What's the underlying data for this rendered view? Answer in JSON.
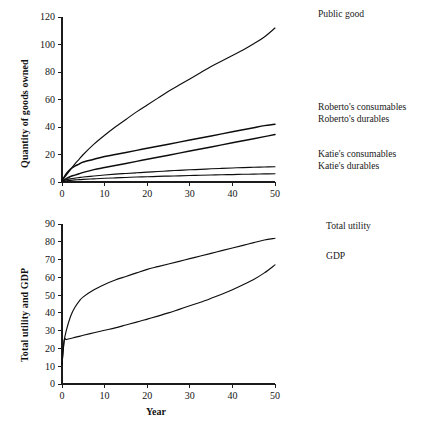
{
  "figure": {
    "background": "#ffffff",
    "line_color": "#0d0d0d"
  },
  "panels": {
    "top": {
      "ylabel": "Quantity of goods owned",
      "xlabel": "",
      "yticks": [
        "0",
        "20",
        "40",
        "60",
        "80",
        "100",
        "120"
      ],
      "xticks": [
        "0",
        "10",
        "20",
        "30",
        "40",
        "50"
      ],
      "legend": [
        {
          "label": "Public good"
        },
        {
          "label": "Roberto's consumables"
        },
        {
          "label": "Roberto's durables"
        },
        {
          "label": "Katie's consumables"
        },
        {
          "label": "Katie's durables"
        }
      ]
    },
    "bottom": {
      "ylabel": "Total utility and GDP",
      "xlabel": "Year",
      "yticks": [
        "0",
        "10",
        "20",
        "30",
        "40",
        "50",
        "60",
        "70",
        "80",
        "90"
      ],
      "xticks": [
        "0",
        "10",
        "20",
        "30",
        "40",
        "50"
      ],
      "legend": [
        {
          "label": "Total utility"
        },
        {
          "label": "GDP"
        }
      ]
    }
  },
  "chart_data": [
    {
      "type": "line",
      "title": "",
      "xlabel": "",
      "ylabel": "Quantity of goods owned",
      "xlim": [
        0,
        50
      ],
      "ylim": [
        0,
        120
      ],
      "xticks": [
        0,
        10,
        20,
        30,
        40,
        50
      ],
      "yticks": [
        0,
        20,
        40,
        60,
        80,
        100,
        120
      ],
      "grid": false,
      "legend_position": "right-outside",
      "x": [
        0,
        1,
        2,
        3,
        4,
        5,
        7.5,
        10,
        12.5,
        15,
        17.5,
        20,
        22.5,
        25,
        27.5,
        30,
        32.5,
        35,
        37.5,
        40,
        42.5,
        45,
        47.5,
        50
      ],
      "series": [
        {
          "name": "Public good",
          "values": [
            1,
            5,
            9,
            13,
            16.5,
            20,
            27.5,
            34,
            40,
            45.5,
            51,
            56,
            61,
            66,
            70.5,
            75,
            79.5,
            84,
            88,
            92,
            96,
            100.5,
            105.5,
            112
          ]
        },
        {
          "name": "Roberto's consumables",
          "values": [
            1,
            6,
            9.5,
            11.5,
            13,
            14.5,
            16.5,
            18.5,
            20,
            21.5,
            23,
            24.5,
            26,
            27.5,
            29,
            30.5,
            32,
            33.5,
            35,
            36.5,
            38,
            39.5,
            41,
            42
          ]
        },
        {
          "name": "Roberto's durables",
          "values": [
            0.5,
            2.5,
            4,
            5,
            6,
            7,
            9,
            10.5,
            12,
            13.5,
            15,
            16.5,
            18,
            19.5,
            21,
            22.5,
            24,
            25.5,
            27,
            28.5,
            30,
            31.5,
            33,
            34.5
          ]
        },
        {
          "name": "Katie's consumables",
          "values": [
            0.4,
            1.6,
            2.3,
            2.8,
            3.2,
            3.6,
            4.4,
            5.1,
            5.7,
            6.2,
            6.7,
            7.2,
            7.6,
            8.1,
            8.5,
            8.9,
            9.2,
            9.6,
            9.9,
            10.2,
            10.5,
            10.7,
            10.9,
            11.1
          ]
        },
        {
          "name": "Katie's durables",
          "values": [
            0.2,
            0.8,
            1.2,
            1.5,
            1.7,
            1.9,
            2.3,
            2.7,
            3.0,
            3.3,
            3.6,
            3.8,
            4.1,
            4.3,
            4.5,
            4.7,
            4.9,
            5.1,
            5.3,
            5.4,
            5.6,
            5.7,
            5.9,
            6.0
          ]
        }
      ]
    },
    {
      "type": "line",
      "title": "",
      "xlabel": "Year",
      "ylabel": "Total utility and GDP",
      "xlim": [
        0,
        50
      ],
      "ylim": [
        0,
        90
      ],
      "xticks": [
        0,
        10,
        20,
        30,
        40,
        50
      ],
      "yticks": [
        0,
        10,
        20,
        30,
        40,
        50,
        60,
        70,
        80,
        90
      ],
      "grid": false,
      "legend_position": "right-outside",
      "x": [
        0,
        0.5,
        1,
        2,
        3,
        4,
        5,
        7.5,
        10,
        12.5,
        15,
        17.5,
        20,
        22.5,
        25,
        27.5,
        30,
        32.5,
        35,
        37.5,
        40,
        42.5,
        45,
        47.5,
        50
      ],
      "series": [
        {
          "name": "Total utility",
          "values": [
            11,
            24,
            30,
            38,
            43,
            46.5,
            49,
            53,
            56,
            58.5,
            60.5,
            62.5,
            64.5,
            66,
            67.5,
            69,
            70.5,
            72,
            73.5,
            75,
            76.5,
            78,
            79.5,
            81,
            82
          ]
        },
        {
          "name": "GDP",
          "values": [
            11,
            24.5,
            25,
            25.6,
            26.2,
            26.8,
            27.4,
            28.8,
            30.2,
            31.6,
            33.2,
            34.8,
            36.5,
            38.2,
            40,
            42,
            44,
            46,
            48.2,
            50.5,
            53,
            55.8,
            58.8,
            62.5,
            67
          ]
        }
      ]
    }
  ]
}
